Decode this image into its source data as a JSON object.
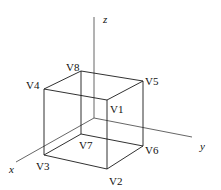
{
  "diagram": {
    "type": "3d-cube-with-axes",
    "axes": [
      {
        "id": "x",
        "label": "x"
      },
      {
        "id": "y",
        "label": "y"
      },
      {
        "id": "z",
        "label": "z"
      }
    ],
    "vertices": [
      {
        "id": "V1",
        "label": "V1"
      },
      {
        "id": "V2",
        "label": "V2"
      },
      {
        "id": "V3",
        "label": "V3"
      },
      {
        "id": "V4",
        "label": "V4"
      },
      {
        "id": "V5",
        "label": "V5"
      },
      {
        "id": "V6",
        "label": "V6"
      },
      {
        "id": "V7",
        "label": "V7"
      },
      {
        "id": "V8",
        "label": "V8"
      }
    ],
    "edges": [
      [
        "V4",
        "V8"
      ],
      [
        "V8",
        "V5"
      ],
      [
        "V5",
        "V1"
      ],
      [
        "V1",
        "V4"
      ],
      [
        "V3",
        "V7"
      ],
      [
        "V7",
        "V6"
      ],
      [
        "V6",
        "V2"
      ],
      [
        "V2",
        "V3"
      ],
      [
        "V4",
        "V3"
      ],
      [
        "V8",
        "V7"
      ],
      [
        "V5",
        "V6"
      ],
      [
        "V1",
        "V2"
      ]
    ]
  }
}
